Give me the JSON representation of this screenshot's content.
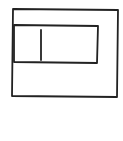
{
  "sketch": {
    "description": "Hand-drawn wireframe of a window containing a text input field with a text cursor",
    "stroke_color": "#222222",
    "background_color": "#ffffff",
    "window_frame": {
      "x1": 13,
      "y1": 9,
      "x2": 118,
      "y2": 10,
      "x3": 117,
      "y3": 97,
      "x4": 12,
      "y4": 96
    },
    "text_input": {
      "x1": 14,
      "y1": 25,
      "x2": 98,
      "y2": 26,
      "x3": 97,
      "y3": 63,
      "x4": 14,
      "y4": 62
    },
    "text_cursor": {
      "x1": 41,
      "y1": 30,
      "x2": 41,
      "y2": 60
    }
  }
}
